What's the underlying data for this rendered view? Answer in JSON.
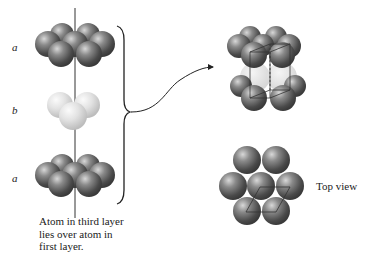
{
  "diagram": {
    "layers": [
      {
        "label": "a",
        "color": "dark-gray"
      },
      {
        "label": "b",
        "color": "light-gray"
      },
      {
        "label": "a",
        "color": "dark-gray"
      }
    ],
    "caption": "Atom in third layer lies over atom in first layer.",
    "caption_lines": [
      "Atom in third layer",
      "lies over atom in",
      "first layer."
    ],
    "top_view_label": "Top view",
    "colors": {
      "dark_sphere": "#6e6e6e",
      "light_sphere": "#dcdcdc",
      "line": "#222222",
      "background": "#ffffff"
    }
  }
}
